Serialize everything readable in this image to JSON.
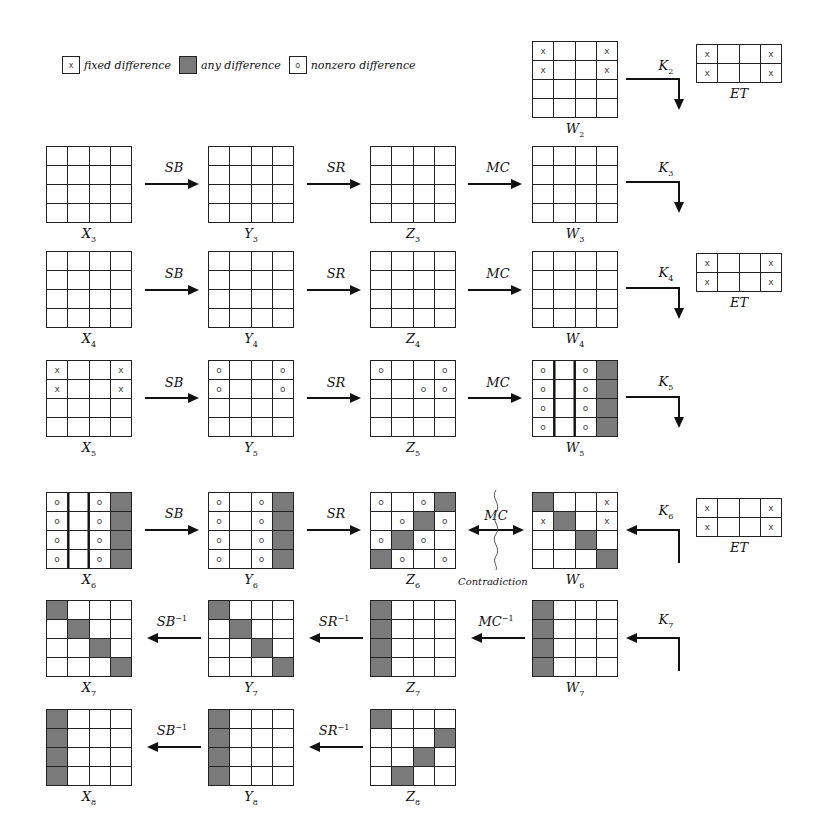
{
  "legend": {
    "fixed": {
      "symbol": "x",
      "label": "fixed difference"
    },
    "any": {
      "symbol": "",
      "label": "any difference"
    },
    "nonzero": {
      "symbol": "o",
      "label": "nonzero difference"
    }
  },
  "cell_codes": {
    "x": "fixed difference",
    "o": "nonzero difference",
    "#": "any difference",
    "": "no difference"
  },
  "states": {
    "W2": {
      "label": "W",
      "sub": "2",
      "cells": [
        [
          "x",
          "",
          "",
          "x"
        ],
        [
          "x",
          "",
          "",
          "x"
        ],
        [
          "",
          "",
          "",
          ""
        ],
        [
          "",
          "",
          "",
          ""
        ]
      ]
    },
    "ET2": {
      "label": "ET",
      "cells": [
        [
          "x",
          "",
          "",
          "x"
        ],
        [
          "x",
          "",
          "",
          "x"
        ]
      ]
    },
    "X3": {
      "label": "X",
      "sub": "3",
      "cells": [
        [
          "",
          "",
          "",
          ""
        ],
        [
          "",
          "",
          "",
          ""
        ],
        [
          "",
          "",
          "",
          ""
        ],
        [
          "",
          "",
          "",
          ""
        ]
      ]
    },
    "Y3": {
      "label": "Y",
      "sub": "3",
      "cells": [
        [
          "",
          "",
          "",
          ""
        ],
        [
          "",
          "",
          "",
          ""
        ],
        [
          "",
          "",
          "",
          ""
        ],
        [
          "",
          "",
          "",
          ""
        ]
      ]
    },
    "Z3": {
      "label": "Z",
      "sub": "3",
      "cells": [
        [
          "",
          "",
          "",
          ""
        ],
        [
          "",
          "",
          "",
          ""
        ],
        [
          "",
          "",
          "",
          ""
        ],
        [
          "",
          "",
          "",
          ""
        ]
      ]
    },
    "W3": {
      "label": "W",
      "sub": "3",
      "cells": [
        [
          "",
          "",
          "",
          ""
        ],
        [
          "",
          "",
          "",
          ""
        ],
        [
          "",
          "",
          "",
          ""
        ],
        [
          "",
          "",
          "",
          ""
        ]
      ]
    },
    "X4": {
      "label": "X",
      "sub": "4",
      "cells": [
        [
          "",
          "",
          "",
          ""
        ],
        [
          "",
          "",
          "",
          ""
        ],
        [
          "",
          "",
          "",
          ""
        ],
        [
          "",
          "",
          "",
          ""
        ]
      ]
    },
    "Y4": {
      "label": "Y",
      "sub": "4",
      "cells": [
        [
          "",
          "",
          "",
          ""
        ],
        [
          "",
          "",
          "",
          ""
        ],
        [
          "",
          "",
          "",
          ""
        ],
        [
          "",
          "",
          "",
          ""
        ]
      ]
    },
    "Z4": {
      "label": "Z",
      "sub": "4",
      "cells": [
        [
          "",
          "",
          "",
          ""
        ],
        [
          "",
          "",
          "",
          ""
        ],
        [
          "",
          "",
          "",
          ""
        ],
        [
          "",
          "",
          "",
          ""
        ]
      ]
    },
    "W4": {
      "label": "W",
      "sub": "4",
      "cells": [
        [
          "",
          "",
          "",
          ""
        ],
        [
          "",
          "",
          "",
          ""
        ],
        [
          "",
          "",
          "",
          ""
        ],
        [
          "",
          "",
          "",
          ""
        ]
      ]
    },
    "ET4": {
      "label": "ET",
      "cells": [
        [
          "x",
          "",
          "",
          "x"
        ],
        [
          "x",
          "",
          "",
          "x"
        ]
      ]
    },
    "X5": {
      "label": "X",
      "sub": "5",
      "cells": [
        [
          "x",
          "",
          "",
          "x"
        ],
        [
          "x",
          "",
          "",
          "x"
        ],
        [
          "",
          "",
          "",
          ""
        ],
        [
          "",
          "",
          "",
          ""
        ]
      ]
    },
    "Y5": {
      "label": "Y",
      "sub": "5",
      "cells": [
        [
          "o",
          "",
          "",
          "o"
        ],
        [
          "o",
          "",
          "",
          "o"
        ],
        [
          "",
          "",
          "",
          ""
        ],
        [
          "",
          "",
          "",
          ""
        ]
      ]
    },
    "Z5": {
      "label": "Z",
      "sub": "5",
      "cells": [
        [
          "o",
          "",
          "",
          "o"
        ],
        [
          "",
          "",
          "o",
          "o"
        ],
        [
          "",
          "",
          "",
          ""
        ],
        [
          "",
          "",
          "",
          ""
        ]
      ]
    },
    "W5": {
      "label": "W",
      "sub": "5",
      "cells": [
        [
          "o",
          "",
          "o",
          "#"
        ],
        [
          "o",
          "",
          "o",
          "#"
        ],
        [
          "o",
          "",
          "o",
          "#"
        ],
        [
          "o",
          "",
          "o",
          "#"
        ]
      ]
    },
    "X6": {
      "label": "X",
      "sub": "6",
      "cells": [
        [
          "o",
          "",
          "o",
          "#"
        ],
        [
          "o",
          "",
          "o",
          "#"
        ],
        [
          "o",
          "",
          "o",
          "#"
        ],
        [
          "o",
          "",
          "o",
          "#"
        ]
      ]
    },
    "Y6": {
      "label": "Y",
      "sub": "6",
      "cells": [
        [
          "o",
          "",
          "o",
          "#"
        ],
        [
          "o",
          "",
          "o",
          "#"
        ],
        [
          "o",
          "",
          "o",
          "#"
        ],
        [
          "o",
          "",
          "o",
          "#"
        ]
      ]
    },
    "Z6": {
      "label": "Z",
      "sub": "6",
      "cells": [
        [
          "o",
          "",
          "o",
          "#"
        ],
        [
          "",
          "o",
          "#",
          "o"
        ],
        [
          "o",
          "#",
          "o",
          ""
        ],
        [
          "#",
          "o",
          "",
          "o"
        ]
      ]
    },
    "W6": {
      "label": "W",
      "sub": "6",
      "cells": [
        [
          "#",
          "",
          "",
          "x"
        ],
        [
          "x",
          "#",
          "",
          "x"
        ],
        [
          "",
          "",
          "#",
          ""
        ],
        [
          "",
          "",
          "",
          "#"
        ]
      ]
    },
    "ET6": {
      "label": "ET",
      "cells": [
        [
          "x",
          "",
          "",
          "x"
        ],
        [
          "x",
          "",
          "",
          "x"
        ]
      ]
    },
    "X7": {
      "label": "X",
      "sub": "7",
      "cells": [
        [
          "#",
          "",
          "",
          ""
        ],
        [
          "",
          "#",
          "",
          ""
        ],
        [
          "",
          "",
          "#",
          ""
        ],
        [
          "",
          "",
          "",
          "#"
        ]
      ]
    },
    "Y7": {
      "label": "Y",
      "sub": "7",
      "cells": [
        [
          "#",
          "",
          "",
          ""
        ],
        [
          "",
          "#",
          "",
          ""
        ],
        [
          "",
          "",
          "#",
          ""
        ],
        [
          "",
          "",
          "",
          "#"
        ]
      ]
    },
    "Z7": {
      "label": "Z",
      "sub": "7",
      "cells": [
        [
          "#",
          "",
          "",
          ""
        ],
        [
          "#",
          "",
          "",
          ""
        ],
        [
          "#",
          "",
          "",
          ""
        ],
        [
          "#",
          "",
          "",
          ""
        ]
      ]
    },
    "W7": {
      "label": "W",
      "sub": "7",
      "cells": [
        [
          "#",
          "",
          "",
          ""
        ],
        [
          "#",
          "",
          "",
          ""
        ],
        [
          "#",
          "",
          "",
          ""
        ],
        [
          "#",
          "",
          "",
          ""
        ]
      ]
    },
    "X8": {
      "label": "X",
      "sub": "8",
      "cells": [
        [
          "#",
          "",
          "",
          ""
        ],
        [
          "#",
          "",
          "",
          ""
        ],
        [
          "#",
          "",
          "",
          ""
        ],
        [
          "#",
          "",
          "",
          ""
        ]
      ]
    },
    "Y8": {
      "label": "Y",
      "sub": "8",
      "cells": [
        [
          "#",
          "",
          "",
          ""
        ],
        [
          "#",
          "",
          "",
          ""
        ],
        [
          "#",
          "",
          "",
          ""
        ],
        [
          "#",
          "",
          "",
          ""
        ]
      ]
    },
    "Z8": {
      "label": "Z",
      "sub": "8",
      "cells": [
        [
          "#",
          "",
          "",
          ""
        ],
        [
          "",
          "",
          "",
          "#"
        ],
        [
          "",
          "",
          "#",
          ""
        ],
        [
          "",
          "#",
          "",
          ""
        ]
      ]
    }
  },
  "ops": {
    "SB": "SB",
    "SR": "SR",
    "MC": "MC",
    "SB_inv": "SB",
    "SR_inv": "SR",
    "MC_inv": "MC",
    "inv_exp": "−1",
    "K": "K",
    "K2": "2",
    "K3": "3",
    "K4": "4",
    "K5": "5",
    "K6": "6",
    "K7": "7"
  },
  "contradiction": "Contradiction"
}
